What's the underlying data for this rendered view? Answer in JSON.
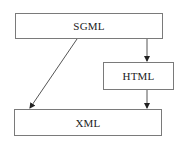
{
  "diagram": {
    "nodes": [
      {
        "id": "sgml",
        "label": "SGML",
        "x": 15,
        "y": 13,
        "w": 148,
        "h": 26
      },
      {
        "id": "html",
        "label": "HTML",
        "x": 103,
        "y": 62,
        "w": 71,
        "h": 28
      },
      {
        "id": "xml",
        "label": "XML",
        "x": 14,
        "y": 109,
        "w": 148,
        "h": 27
      }
    ],
    "edges": [
      {
        "from": "SGML",
        "to": "HTML"
      },
      {
        "from": "SGML",
        "to": "XML"
      },
      {
        "from": "HTML",
        "to": "XML"
      }
    ],
    "colors": {
      "stroke": "#7a7a7a",
      "arrow": "#222222",
      "text": "#222222"
    }
  }
}
